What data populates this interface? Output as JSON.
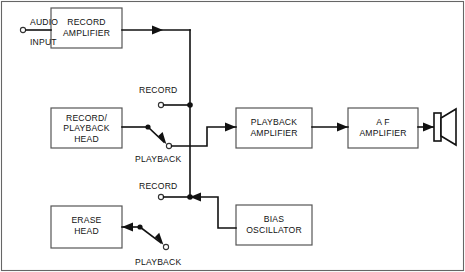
{
  "diagram": {
    "colors": {
      "wire": "#111111",
      "box_stroke": "#555555",
      "background": "#ffffff",
      "border": "#666666"
    },
    "blocks": [
      {
        "id": "record-amplifier",
        "lines": [
          "RECORD",
          "AMPLIFIER"
        ],
        "x": 51,
        "y": 8,
        "w": 71,
        "h": 40
      },
      {
        "id": "record-playback-head",
        "lines": [
          "RECORD/",
          "PLAYBACK",
          "HEAD"
        ],
        "x": 51,
        "y": 108,
        "w": 71,
        "h": 40
      },
      {
        "id": "erase-head",
        "lines": [
          "ERASE",
          "HEAD"
        ],
        "x": 51,
        "y": 206,
        "w": 71,
        "h": 42
      },
      {
        "id": "playback-amplifier",
        "lines": [
          "PLAYBACK",
          "AMPLIFIER"
        ],
        "x": 236,
        "y": 108,
        "w": 76,
        "h": 40
      },
      {
        "id": "af-amplifier",
        "lines": [
          "A F",
          "AMPLIFIER"
        ],
        "x": 348,
        "y": 108,
        "w": 70,
        "h": 40
      },
      {
        "id": "bias-oscillator",
        "lines": [
          "BIAS",
          "OSCILLATOR"
        ],
        "x": 236,
        "y": 205,
        "w": 76,
        "h": 40
      }
    ],
    "labels": {
      "audio": "AUDIO",
      "input": "INPUT",
      "record_upper": "RECORD",
      "playback_upper": "PLAYBACK",
      "record_lower": "RECORD",
      "playback_lower": "PLAYBACK",
      "record_amplifier_l1": "RECORD",
      "record_amplifier_l2": "AMPLIFIER",
      "head_l1": "RECORD/",
      "head_l2": "PLAYBACK",
      "head_l3": "HEAD",
      "erase_l1": "ERASE",
      "erase_l2": "HEAD",
      "playback_amp_l1": "PLAYBACK",
      "playback_amp_l2": "AMPLIFIER",
      "af_amp_l1": "A F",
      "af_amp_l2": "AMPLIFIER",
      "bias_l1": "BIAS",
      "bias_l2": "OSCILLATOR"
    },
    "components": {
      "speaker": "loudspeaker-symbol",
      "input_terminal": "input-terminal",
      "switch_upper": "record-playback-selector-switch",
      "switch_lower": "erase-record-playback-switch"
    }
  }
}
